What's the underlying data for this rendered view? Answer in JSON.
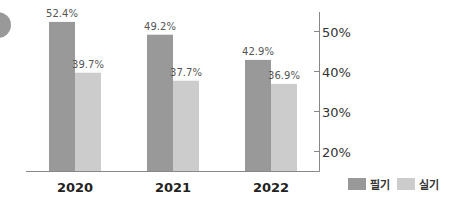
{
  "chart_data": {
    "type": "bar",
    "title": "",
    "xlabel": "",
    "ylabel": "",
    "categories": [
      "2020",
      "2021",
      "2022"
    ],
    "series": [
      {
        "name": "필기",
        "values": [
          52.4,
          49.2,
          42.9
        ],
        "labels": [
          "52.4%",
          "49.2%",
          "42.9%"
        ],
        "color": "#999999"
      },
      {
        "name": "실기",
        "values": [
          39.7,
          37.7,
          36.9
        ],
        "labels": [
          "39.7%",
          "37.7%",
          "36.9%"
        ],
        "color": "#cccccc"
      }
    ],
    "ylim": [
      15,
      55
    ],
    "yticks": [
      20,
      30,
      40,
      50
    ],
    "ytick_labels": [
      "20%",
      "30%",
      "40%",
      "50%"
    ],
    "y_axis_side": "right",
    "grid": false,
    "legend_position": "bottom-right"
  },
  "decoration": {
    "circle_color": "#999999"
  }
}
